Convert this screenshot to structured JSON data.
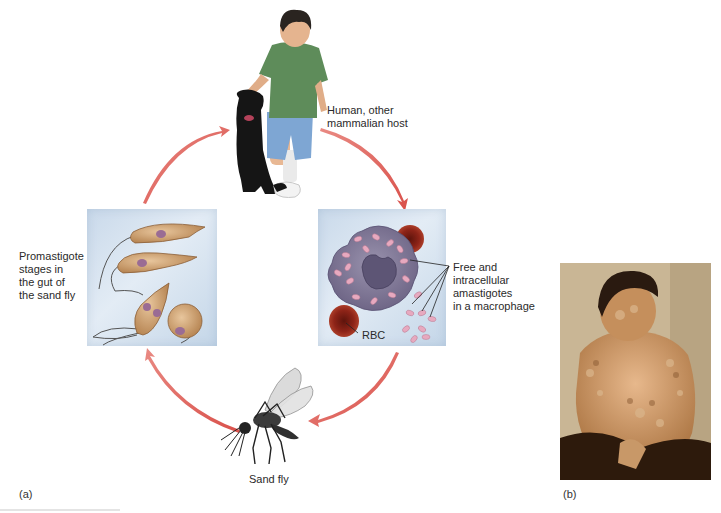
{
  "figure": {
    "panel_a_label": "(a)",
    "panel_b_label": "(b)",
    "colors": {
      "arrow": "#e2625c",
      "panel_bg": "#d5e2ef",
      "promastigote": "#c99a6a",
      "macrophage": "#7c7493",
      "amastigote": "#e7a9bf",
      "rbc": "#8e2418"
    }
  },
  "cycle": {
    "stages": [
      {
        "id": "host",
        "label": "Human, other mammalian host",
        "line1": "Human, other",
        "line2": "mammalian host"
      },
      {
        "id": "macrophage",
        "label": "Free and intracellular amastigotes in a macrophage",
        "line1": "Free and",
        "line2": "intracellular",
        "line3": "amastigotes",
        "line4": "in a macrophage",
        "rbc_label": "RBC"
      },
      {
        "id": "sandfly",
        "label": "Sand fly"
      },
      {
        "id": "promastigote",
        "label": "Promastigote stages in the gut of the sand fly",
        "line1": "Promastigote",
        "line2": "stages in",
        "line3": "the gut of",
        "line4": "the sand fly"
      }
    ],
    "arrows": [
      {
        "from": "promastigote",
        "to": "host"
      },
      {
        "from": "host",
        "to": "macrophage"
      },
      {
        "from": "macrophage",
        "to": "sandfly"
      },
      {
        "from": "sandfly",
        "to": "promastigote"
      }
    ]
  },
  "photo": {
    "description": "Patient with disseminated cutaneous leishmaniasis lesions"
  }
}
